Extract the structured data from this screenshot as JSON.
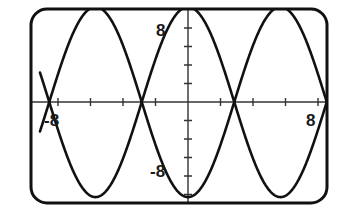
{
  "figure": {
    "frame": {
      "shape": "rounded-rectangle",
      "stroke_color": "#111111",
      "fill_color": "#ffffff",
      "x": 31,
      "y": 9,
      "width": 296,
      "height": 194,
      "radius": 16,
      "stroke_width": 3
    },
    "axes": {
      "color": "#333333",
      "stroke_width": 1.4,
      "origin_x": 188,
      "origin_y": 102,
      "x_tick_spacing": 32.5,
      "y_tick_spacing": 18.5,
      "tick_half_length": 4
    },
    "curve_style": {
      "color": "#111111",
      "stroke_width": 2.6
    }
  },
  "labels": {
    "x_negative": "-8",
    "x_positive": "8",
    "y_positive": "8",
    "y_negative": "-8"
  },
  "chart_data": {
    "type": "line",
    "title": "",
    "xlabel": "",
    "ylabel": "",
    "xlim": [
      -14.4,
      14.4
    ],
    "ylim": [
      -10.2,
      10.2
    ],
    "grid": false,
    "legend": false,
    "x_ticks": [
      -12,
      -8,
      -4,
      4,
      8,
      12
    ],
    "x_tick_labels": [
      "",
      "-8",
      "",
      "",
      "8",
      ""
    ],
    "y_ticks": [
      -8,
      -4,
      4,
      8
    ],
    "y_tick_labels": [
      "-8",
      "",
      "",
      "8"
    ],
    "annotations": [
      "curves intersect on the x-axis at x = -9, 0, 9",
      "amplitude reaches the top and bottom frame edges"
    ],
    "series": [
      {
        "name": "y = 10 cos(pi x / 9)",
        "formula": "10*cos(pi*x/9)",
        "amplitude": 10,
        "period": 18,
        "phase": 0,
        "color": "#111111",
        "x": [
          -14.4,
          -13.5,
          -12.6,
          -11.7,
          -10.8,
          -9.9,
          -9.0,
          -8.1,
          -7.2,
          -6.3,
          -5.4,
          -4.5,
          -3.6,
          -2.7,
          -1.8,
          -0.9,
          0.0,
          0.9,
          1.8,
          2.7,
          3.6,
          4.5,
          5.4,
          6.3,
          7.2,
          8.1,
          9.0,
          9.9,
          10.8,
          11.7,
          12.6,
          13.5,
          14.4
        ],
        "values": [
          -8.09,
          -10.0,
          -9.4,
          -7.1,
          -3.47,
          0.0,
          3.47,
          7.1,
          9.4,
          10.0,
          8.09,
          5.0,
          1.74,
          -1.74,
          -5.0,
          -8.09,
          -10.0,
          -8.09,
          -5.0,
          -1.74,
          1.74,
          5.0,
          8.09,
          10.0,
          9.4,
          7.1,
          3.47,
          0.0,
          -3.47,
          -7.1,
          -9.4,
          -10.0,
          -8.09
        ]
      },
      {
        "name": "y = -10 cos(pi x / 9)",
        "formula": "-10*cos(pi*x/9)",
        "amplitude": 10,
        "period": 18,
        "phase": 3.14159,
        "color": "#111111",
        "x": [
          -14.4,
          -13.5,
          -12.6,
          -11.7,
          -10.8,
          -9.9,
          -9.0,
          -8.1,
          -7.2,
          -6.3,
          -5.4,
          -4.5,
          -3.6,
          -2.7,
          -1.8,
          -0.9,
          0.0,
          0.9,
          1.8,
          2.7,
          3.6,
          4.5,
          5.4,
          6.3,
          7.2,
          8.1,
          9.0,
          9.9,
          10.8,
          11.7,
          12.6,
          13.5,
          14.4
        ],
        "values": [
          8.09,
          10.0,
          9.4,
          7.1,
          3.47,
          0.0,
          -3.47,
          -7.1,
          -9.4,
          -10.0,
          -8.09,
          -5.0,
          -1.74,
          1.74,
          5.0,
          8.09,
          10.0,
          8.09,
          5.0,
          1.74,
          -1.74,
          -5.0,
          -8.09,
          -10.0,
          -9.4,
          -7.1,
          -3.47,
          0.0,
          3.47,
          7.1,
          9.4,
          10.0,
          8.09
        ]
      }
    ]
  }
}
